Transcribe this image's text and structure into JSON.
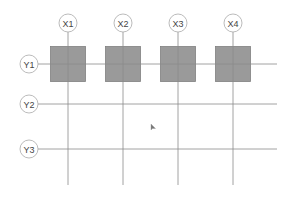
{
  "diagram": {
    "type": "structural-grid",
    "columns": [
      {
        "label": "X1",
        "x": 68
      },
      {
        "label": "X2",
        "x": 123
      },
      {
        "label": "X3",
        "x": 178
      },
      {
        "label": "X4",
        "x": 233
      }
    ],
    "rows": [
      {
        "label": "Y1",
        "y": 64
      },
      {
        "label": "Y2",
        "y": 104
      },
      {
        "label": "Y3",
        "y": 149
      }
    ],
    "columns_elements": {
      "row": "Y1",
      "count": 4,
      "size": 35,
      "fill": "#9a9a9a"
    },
    "colors": {
      "line": "#8a8a8a",
      "bubble_stroke": "#aaaaaa",
      "text": "#444444",
      "square_fill": "#9a9a9a",
      "square_stroke": "#808080"
    },
    "cursor": {
      "x": 151,
      "y": 124,
      "icon": "mouse-pointer-icon"
    }
  }
}
